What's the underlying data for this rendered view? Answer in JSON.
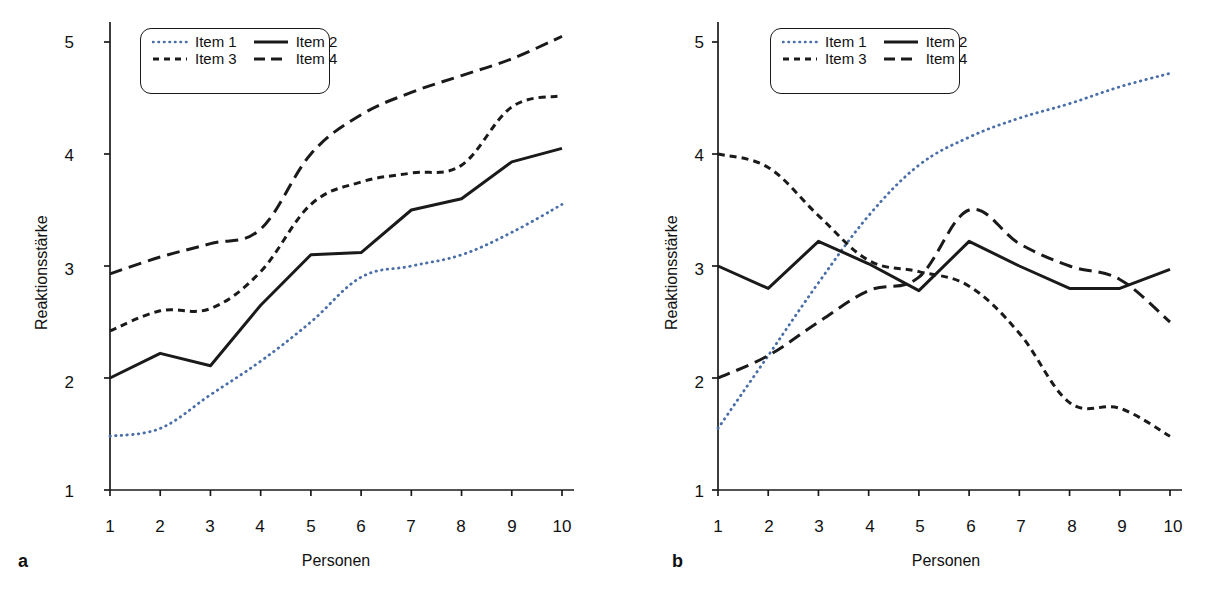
{
  "figure": {
    "background": "#ffffff",
    "ink": "#1a1a1a",
    "accent_blue": "#4a6ea8"
  },
  "panels": [
    {
      "letter": "a",
      "axis": {
        "xlabel": "Personen",
        "ylabel": "Reaktionsstärke",
        "xticks": [
          "1",
          "2",
          "3",
          "4",
          "5",
          "6",
          "7",
          "8",
          "9",
          "10"
        ],
        "yticks": [
          "1",
          "2",
          "3",
          "4",
          "5"
        ]
      },
      "legend": {
        "entries": [
          {
            "label": "Item 1",
            "style": "dotted",
            "color": "#4a6ea8"
          },
          {
            "label": "Item 2",
            "style": "solid",
            "color": "#1a1a1a"
          },
          {
            "label": "Item 3",
            "style": "short-dash",
            "color": "#1a1a1a"
          },
          {
            "label": "Item 4",
            "style": "long-dash",
            "color": "#1a1a1a"
          }
        ]
      }
    },
    {
      "letter": "b",
      "axis": {
        "xlabel": "Personen",
        "ylabel": "Reaktionsstärke",
        "xticks": [
          "1",
          "2",
          "3",
          "4",
          "5",
          "6",
          "7",
          "8",
          "9",
          "10"
        ],
        "yticks": [
          "1",
          "2",
          "3",
          "4",
          "5"
        ]
      },
      "legend": {
        "entries": [
          {
            "label": "Item 1",
            "style": "dotted",
            "color": "#4a6ea8"
          },
          {
            "label": "Item 2",
            "style": "solid",
            "color": "#1a1a1a"
          },
          {
            "label": "Item 3",
            "style": "short-dash",
            "color": "#1a1a1a"
          },
          {
            "label": "Item 4",
            "style": "long-dash",
            "color": "#1a1a1a"
          }
        ]
      }
    }
  ],
  "chart_data": [
    {
      "id": "a",
      "type": "line",
      "title": "",
      "subtitle": "",
      "xlabel": "Personen",
      "ylabel": "Reaktionsstärke",
      "xlim": [
        1,
        10
      ],
      "ylim": [
        1,
        5
      ],
      "grid": false,
      "legend_position": "top-left",
      "x": [
        1,
        2,
        3,
        4,
        5,
        6,
        7,
        8,
        9,
        10
      ],
      "series": [
        {
          "name": "Item 1",
          "style": "dotted",
          "color": "#4a6ea8",
          "values": [
            1.48,
            1.55,
            1.85,
            2.15,
            2.5,
            2.9,
            3.0,
            3.1,
            3.3,
            3.55
          ]
        },
        {
          "name": "Item 2",
          "style": "solid",
          "color": "#1a1a1a",
          "values": [
            2.0,
            2.22,
            2.11,
            2.65,
            3.1,
            3.12,
            3.5,
            3.6,
            3.93,
            4.05
          ]
        },
        {
          "name": "Item 3",
          "style": "short-dash",
          "color": "#1a1a1a",
          "values": [
            2.42,
            2.6,
            2.62,
            2.95,
            3.55,
            3.75,
            3.83,
            3.9,
            4.42,
            4.52
          ]
        },
        {
          "name": "Item 4",
          "style": "long-dash",
          "color": "#1a1a1a",
          "values": [
            2.93,
            3.08,
            3.2,
            3.33,
            4.0,
            4.35,
            4.55,
            4.7,
            4.85,
            5.05
          ]
        }
      ]
    },
    {
      "id": "b",
      "type": "line",
      "title": "",
      "subtitle": "",
      "xlabel": "Personen",
      "ylabel": "Reaktionsstärke",
      "xlim": [
        1,
        10
      ],
      "ylim": [
        1,
        5
      ],
      "grid": false,
      "legend_position": "top-left",
      "x": [
        1,
        2,
        3,
        4,
        5,
        6,
        7,
        8,
        9,
        10
      ],
      "series": [
        {
          "name": "Item 1",
          "style": "dotted",
          "color": "#4a6ea8",
          "values": [
            1.55,
            2.2,
            2.85,
            3.45,
            3.9,
            4.15,
            4.32,
            4.45,
            4.6,
            4.72
          ]
        },
        {
          "name": "Item 2",
          "style": "solid",
          "color": "#1a1a1a",
          "values": [
            3.0,
            2.8,
            3.22,
            3.02,
            2.78,
            3.22,
            3.0,
            2.8,
            2.8,
            2.97
          ]
        },
        {
          "name": "Item 3",
          "style": "short-dash",
          "color": "#1a1a1a",
          "values": [
            4.0,
            3.88,
            3.45,
            3.05,
            2.95,
            2.82,
            2.4,
            1.78,
            1.73,
            1.48
          ]
        },
        {
          "name": "Item 4",
          "style": "long-dash",
          "color": "#1a1a1a",
          "values": [
            2.0,
            2.2,
            2.5,
            2.78,
            2.9,
            3.5,
            3.2,
            3.0,
            2.88,
            2.5
          ]
        }
      ]
    }
  ]
}
